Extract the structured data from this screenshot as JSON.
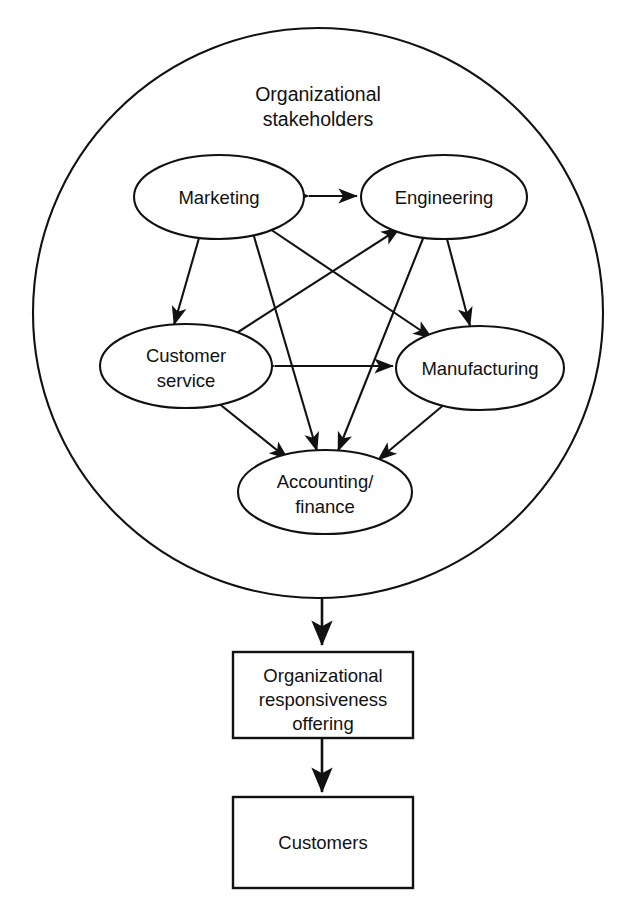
{
  "diagram": {
    "title": "Organizational stakeholders",
    "title_lines": [
      "Organizational",
      "stakeholders"
    ],
    "container_shape": "circle",
    "stroke_color": "#111111",
    "background_color": "#ffffff",
    "nodes": [
      {
        "id": "marketing",
        "label": "Marketing",
        "lines": [
          "Marketing"
        ],
        "shape": "ellipse",
        "cx": 219,
        "cy": 197,
        "rx": 85,
        "ry": 42
      },
      {
        "id": "engineering",
        "label": "Engineering",
        "lines": [
          "Engineering"
        ],
        "shape": "ellipse",
        "cx": 444,
        "cy": 197,
        "rx": 83,
        "ry": 42
      },
      {
        "id": "customer",
        "label": "Customer service",
        "lines": [
          "Customer",
          "service"
        ],
        "shape": "ellipse",
        "cx": 186,
        "cy": 366,
        "rx": 86,
        "ry": 42
      },
      {
        "id": "manufacturing",
        "label": "Manufacturing",
        "lines": [
          "Manufacturing"
        ],
        "shape": "ellipse",
        "cx": 480,
        "cy": 368,
        "rx": 84,
        "ry": 42
      },
      {
        "id": "accounting",
        "label": "Accounting/ finance",
        "lines": [
          "Accounting/",
          "finance"
        ],
        "shape": "ellipse",
        "cx": 325,
        "cy": 492,
        "rx": 87,
        "ry": 42
      }
    ],
    "edges": [
      {
        "from": "marketing",
        "to": "engineering",
        "direction": "both"
      },
      {
        "from": "marketing",
        "to": "customer",
        "direction": "both"
      },
      {
        "from": "marketing",
        "to": "manufacturing",
        "direction": "both"
      },
      {
        "from": "marketing",
        "to": "accounting",
        "direction": "both"
      },
      {
        "from": "engineering",
        "to": "customer",
        "direction": "both"
      },
      {
        "from": "engineering",
        "to": "manufacturing",
        "direction": "both"
      },
      {
        "from": "engineering",
        "to": "accounting",
        "direction": "both"
      },
      {
        "from": "customer",
        "to": "manufacturing",
        "direction": "both"
      },
      {
        "from": "customer",
        "to": "accounting",
        "direction": "both"
      },
      {
        "from": "manufacturing",
        "to": "accounting",
        "direction": "both"
      }
    ],
    "boxes": [
      {
        "id": "responsiveness",
        "label": "Organizational responsiveness offering",
        "lines": [
          "Organizational",
          "responsiveness",
          "offering"
        ]
      },
      {
        "id": "customers",
        "label": "Customers",
        "lines": [
          "Customers"
        ]
      }
    ],
    "flow_arrows": [
      {
        "from": "stakeholders-circle",
        "to": "responsiveness",
        "direction": "down"
      },
      {
        "from": "responsiveness",
        "to": "customers",
        "direction": "down"
      }
    ]
  }
}
